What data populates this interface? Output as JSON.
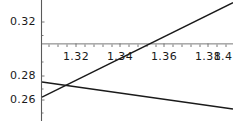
{
  "chart_data": {
    "type": "line",
    "title": "",
    "subtitle": "",
    "xlabel": "",
    "ylabel": "",
    "grid": false,
    "legend": null,
    "xlim": [
      1.3045,
      1.4115
    ],
    "ylim": [
      0.2455,
      0.3365
    ],
    "x_ticks": [
      {
        "value": 1.32,
        "label": "1.32"
      },
      {
        "value": 1.34,
        "label": "1.34"
      },
      {
        "value": 1.36,
        "label": "1.36"
      },
      {
        "value": 1.38,
        "label": "1.38"
      },
      {
        "value": 1.4,
        "label": "1.4"
      }
    ],
    "y_ticks": [
      {
        "value": 0.32,
        "label": "0.32"
      },
      {
        "value": 0.28,
        "label": "0.28"
      },
      {
        "value": 0.26,
        "label": "0.26"
      }
    ],
    "axis_origin_y": 0.3035,
    "series": [
      {
        "name": "rising-line",
        "color": "#1a1a1a",
        "x": [
          1.3045,
          1.4115
        ],
        "values": [
          0.2635,
          0.3345
        ]
      },
      {
        "name": "falling-line",
        "color": "#1a1a1a",
        "x": [
          1.3045,
          1.4115
        ],
        "values": [
          0.2748,
          0.2545
        ]
      }
    ],
    "intersection": {
      "x": 1.3125,
      "y": 0.2688
    }
  },
  "axes": {
    "x_axis_color": "#555555",
    "y_axis_color": "#555555"
  }
}
